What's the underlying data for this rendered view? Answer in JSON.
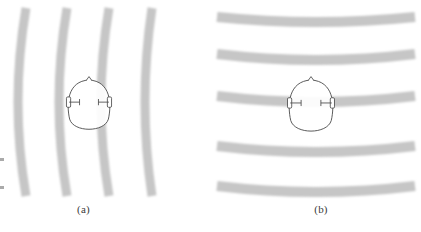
{
  "figure": {
    "type": "scientific-illustration",
    "background_color": "#ffffff",
    "width": 421,
    "height": 232
  },
  "panels": [
    {
      "id": "a",
      "caption": "(a)",
      "description": "curved (spherical) wavefronts from a nearby sound source",
      "wavefront": {
        "orientation": "vertical-arcs",
        "curvature": "convex-left",
        "count": 4,
        "band_color": "#c6c6c6",
        "band_thickness_px": 9,
        "positions_top_px": [
          26,
          67,
          109,
          152
        ],
        "positions_middle_px": [
          18,
          59,
          101,
          145
        ],
        "positions_bottom_px": [
          26,
          67,
          109,
          152
        ]
      },
      "head": {
        "center_x": 89,
        "center_y": 107,
        "radius_x": 22,
        "radius_y": 27,
        "outline_color": "#4a4a4a",
        "nose_label": "nose-marker",
        "ears": [
          "left-ear",
          "right-ear"
        ]
      }
    },
    {
      "id": "b",
      "caption": "(b)",
      "description": "nearly planar wavefronts from a distant sound source",
      "wavefront": {
        "orientation": "horizontal-arcs",
        "curvature": "convex-up",
        "count": 5,
        "band_color": "#c6c6c6",
        "band_thickness_px": 10,
        "positions_left_px": [
          17,
          54,
          96,
          146,
          186
        ],
        "positions_middle_px": [
          22,
          60,
          102,
          152,
          192
        ],
        "positions_right_px": [
          17,
          54,
          96,
          146,
          186
        ]
      },
      "head": {
        "center_x": 100,
        "center_y": 108,
        "radius_x": 23,
        "radius_y": 28,
        "outline_color": "#4a4a4a",
        "nose_label": "nose-marker",
        "ears": [
          "left-ear",
          "right-ear"
        ]
      }
    }
  ],
  "colors": {
    "band": "#c6c6c6",
    "band_light": "#d8d8d8",
    "outline": "#4a4a4a",
    "caption": "#3a3a3a",
    "background": "#ffffff"
  },
  "edge_artifacts": {
    "description": "scan artifacts at left margin",
    "marks": [
      {
        "y": 158
      },
      {
        "y": 186
      }
    ]
  }
}
